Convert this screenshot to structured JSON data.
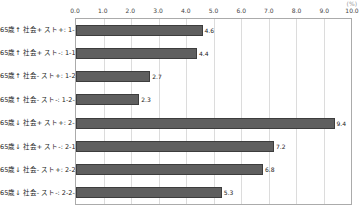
{
  "chart": {
    "unit_label": "(%)"
  },
  "chart_data": {
    "type": "bar",
    "orientation": "horizontal",
    "title": "",
    "xlabel": "(%)",
    "ylabel": "",
    "categories": [
      "65歳↑ 社会+ スト+: 1-1-1",
      "65歳↑ 社会+ スト-: 1-1-2",
      "65歳↑ 社会- スト+: 1-2-1",
      "65歳↑ 社会- スト-: 1-2-2",
      "65歳↓ 社会+ スト+: 2-1-1",
      "65歳↓ 社会+ スト-: 2-1-2",
      "65歳↓ 社会- スト+: 2-2-1",
      "65歳↓ 社会- スト-: 2-2-2"
    ],
    "values": [
      4.6,
      4.4,
      2.7,
      2.3,
      9.4,
      7.2,
      6.8,
      5.3
    ],
    "value_labels": [
      "4.6",
      "4.4",
      "2.7",
      "2.3",
      "9.4",
      "7.2",
      "6.8",
      "5.3"
    ],
    "xlim": [
      0,
      10
    ],
    "xticks": [
      0,
      1,
      2,
      3,
      4,
      5,
      6,
      7,
      8,
      9,
      10
    ],
    "xtick_labels": [
      "0.0",
      "1.0",
      "2.0",
      "3.0",
      "4.0",
      "5.0",
      "6.0",
      "7.0",
      "8.0",
      "9.0",
      "10.0"
    ],
    "grid": true,
    "legend": false,
    "bar_color": "#5f5f5f",
    "gridline_color": "#dcdcdc"
  }
}
